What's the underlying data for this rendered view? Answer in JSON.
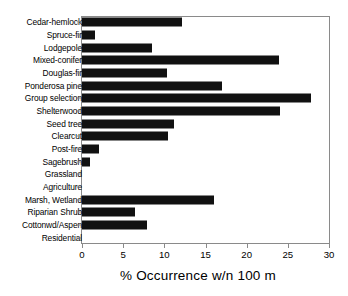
{
  "chart_data": {
    "type": "bar",
    "orientation": "horizontal",
    "title": "",
    "xlabel": "% Occurrence w/n 100 m",
    "ylabel": "",
    "xlim": [
      0,
      30
    ],
    "xticks": [
      0,
      5,
      10,
      15,
      20,
      25,
      30
    ],
    "grid": false,
    "legend": null,
    "bar_color": "#111111",
    "categories": [
      "Cedar-hemlock",
      "Spruce-fir",
      "Lodgepole",
      "Mixed-conifer",
      "Douglas-fir",
      "Ponderosa pine",
      "Group selection",
      "Shelterwood",
      "Seed tree",
      "Clearcut",
      "Post-fire",
      "Sagebrush",
      "Grassland",
      "Agriculture",
      "Marsh, Wetland",
      "Riparian Shrub",
      "Cottonwd/Aspen",
      "Residential"
    ],
    "values": [
      12.2,
      1.6,
      8.5,
      23.9,
      10.3,
      17.0,
      27.8,
      24.0,
      11.2,
      10.4,
      2.1,
      1.0,
      0,
      0,
      16.0,
      6.4,
      7.9,
      0
    ]
  }
}
